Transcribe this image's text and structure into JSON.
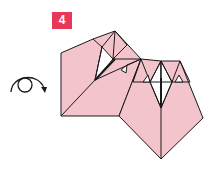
{
  "step": {
    "number": "4",
    "color": "#e8385a"
  },
  "symbol": {
    "name": "turn-over",
    "description": "circular arrow indicating turn model over"
  },
  "colors": {
    "paper": "#f4c4cc",
    "line": "#1a1a1a",
    "white": "#ffffff"
  }
}
